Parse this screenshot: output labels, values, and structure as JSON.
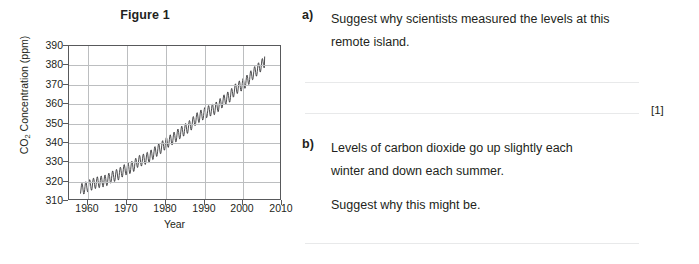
{
  "figure": {
    "title": "Figure 1"
  },
  "chart_data": {
    "type": "line",
    "title": "Figure 1",
    "xlabel": "Year",
    "ylabel": "CO2 Concentration (ppm)",
    "ylabel_html": "CO<sub>2</sub> Concentration (ppm)",
    "xlim": [
      1955,
      2010
    ],
    "ylim": [
      310,
      390
    ],
    "xticks": [
      1960,
      1970,
      1980,
      1990,
      2000,
      2010
    ],
    "yticks": [
      310,
      320,
      330,
      340,
      350,
      360,
      370,
      380,
      390
    ],
    "grid": true,
    "legend": "none",
    "series": [
      {
        "name": "Mauna Loa CO2 annual mean",
        "x": [
          1958,
          1959,
          1960,
          1961,
          1962,
          1963,
          1964,
          1965,
          1966,
          1967,
          1968,
          1969,
          1970,
          1971,
          1972,
          1973,
          1974,
          1975,
          1976,
          1977,
          1978,
          1979,
          1980,
          1981,
          1982,
          1983,
          1984,
          1985,
          1986,
          1987,
          1988,
          1989,
          1990,
          1991,
          1992,
          1993,
          1994,
          1995,
          1996,
          1997,
          1998,
          1999,
          2000,
          2001,
          2002,
          2003,
          2004,
          2005,
          2006
        ],
        "values": [
          315.0,
          315.6,
          316.9,
          317.6,
          318.5,
          318.9,
          319.3,
          320.0,
          321.4,
          322.2,
          323.0,
          324.6,
          325.7,
          326.3,
          327.5,
          329.7,
          330.2,
          331.1,
          332.0,
          333.8,
          335.4,
          336.8,
          338.7,
          340.1,
          341.4,
          343.0,
          344.6,
          346.0,
          347.4,
          349.2,
          351.6,
          353.1,
          354.4,
          355.6,
          356.4,
          357.1,
          358.8,
          360.8,
          362.6,
          363.7,
          366.6,
          368.3,
          369.5,
          371.0,
          373.1,
          375.6,
          377.4,
          379.6,
          381.8
        ]
      }
    ],
    "seasonal_amplitude_ppm": 3.0
  },
  "questions": [
    {
      "marker": "a)",
      "lines": [
        "Suggest why scientists measured the levels at this",
        "remote island."
      ],
      "marks": "[1]"
    },
    {
      "marker": "b)",
      "lines": [
        "Levels of carbon dioxide go up slightly each",
        "winter and down each summer."
      ],
      "extra_lines": [
        "Suggest why this might be."
      ],
      "marks": ""
    }
  ],
  "colors": {
    "text": "#231f20",
    "axis": "#58595b",
    "gridline": "#bcbec0",
    "answer_rule": "#e8e9ea",
    "data_line": "#3a3a3c",
    "background": "#ffffff"
  }
}
